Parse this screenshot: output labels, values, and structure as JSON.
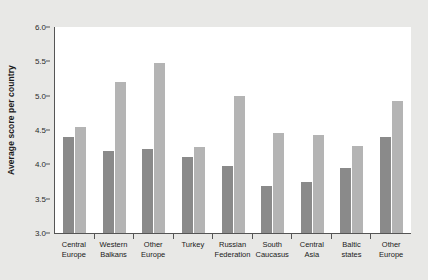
{
  "chart_data": {
    "type": "bar",
    "title": "",
    "subtitle": "",
    "xlabel": "",
    "ylabel": "Average score per country",
    "ylim": [
      3.0,
      6.0
    ],
    "ytick_labels": [
      "3.0",
      "3.5",
      "4.0",
      "4.5",
      "5.0",
      "5.5",
      "6.0"
    ],
    "ytick_values": [
      3.0,
      3.5,
      4.0,
      4.5,
      5.0,
      5.5,
      6.0
    ],
    "grid": false,
    "legend": "none",
    "colors": {
      "series_1": "#8a8a8a",
      "series_2": "#b4b4b4",
      "plot_background": "#ffffff",
      "figure_background": "#e8e8e6",
      "axis": "#555555",
      "text": "#1a1a1a"
    },
    "categories": [
      "Central Europe",
      "Western Balkans",
      "Other Europe",
      "Turkey",
      "Russian Federation",
      "South Caucasus",
      "Central Asia",
      "Baltic states",
      "Other Europe"
    ],
    "category_lines": [
      [
        "Central",
        "Europe"
      ],
      [
        "Western",
        "Balkans"
      ],
      [
        "Other",
        "Europe"
      ],
      [
        "Turkey",
        ""
      ],
      [
        "Russian",
        "Federation"
      ],
      [
        "South",
        "Caucasus"
      ],
      [
        "Central",
        "Asia"
      ],
      [
        "Baltic",
        "states"
      ],
      [
        "Other",
        "Europe"
      ]
    ],
    "series": [
      {
        "name": "series_1",
        "values": [
          4.4,
          4.2,
          4.22,
          4.1,
          3.97,
          3.68,
          3.75,
          3.95,
          4.4
        ]
      },
      {
        "name": "series_2",
        "values": [
          4.55,
          5.2,
          5.48,
          4.25,
          4.99,
          4.45,
          4.43,
          4.27,
          4.92
        ]
      }
    ]
  }
}
